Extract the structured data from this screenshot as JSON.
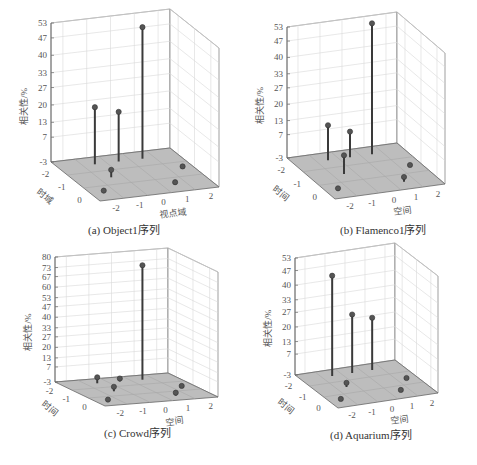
{
  "figure": {
    "panels": [
      {
        "id": "a",
        "caption": "(a) Object1序列",
        "zlabel": "相关性/%",
        "xlabel": "视点域",
        "ylabel": "时域"
      },
      {
        "id": "b",
        "caption": "(b) Flamenco1序列",
        "zlabel": "相关性/%",
        "xlabel": "空间",
        "ylabel": "时间"
      },
      {
        "id": "c",
        "caption": "(c) Crowd序列",
        "zlabel": "相关性/%",
        "xlabel": "空间",
        "ylabel": "时间"
      },
      {
        "id": "d",
        "caption": "(d) Aquarium序列",
        "zlabel": "相关性/%",
        "xlabel": "空间",
        "ylabel": "时间"
      }
    ]
  },
  "chart_data": [
    {
      "type": "scatter",
      "subtype": "3d-stem",
      "title": "(a) Object1序列",
      "xlabel": "视点域",
      "ylabel": "时域",
      "zlabel": "相关性/%",
      "xticks": [
        -2,
        -1,
        0,
        1,
        2
      ],
      "yticks": [
        -2,
        -1,
        0
      ],
      "zticks": [
        -3,
        7,
        13,
        20,
        27,
        33,
        40,
        47,
        53
      ],
      "zlim": [
        -3,
        53
      ],
      "points": [
        {
          "x": -1,
          "y": -2,
          "z": 20
        },
        {
          "x": 0,
          "y": -2,
          "z": 17
        },
        {
          "x": 1,
          "y": -2,
          "z": 50
        },
        {
          "x": -1,
          "y": -1,
          "z": 0
        },
        {
          "x": -2,
          "y": 0,
          "z": -2
        },
        {
          "x": 1,
          "y": 0,
          "z": -2
        },
        {
          "x": 2,
          "y": -1,
          "z": -2
        }
      ],
      "grid": true
    },
    {
      "type": "scatter",
      "subtype": "3d-stem",
      "title": "(b) Flamenco1序列",
      "xlabel": "空间",
      "ylabel": "时间",
      "zlabel": "相关性/%",
      "xticks": [
        -2,
        -1,
        0,
        1,
        2
      ],
      "yticks": [
        -2,
        -1,
        0
      ],
      "zticks": [
        -3,
        7,
        13,
        20,
        27,
        33,
        40,
        47,
        53
      ],
      "zlim": [
        -3,
        53
      ],
      "points": [
        {
          "x": -1,
          "y": -2,
          "z": 12
        },
        {
          "x": 0,
          "y": -2,
          "z": 8
        },
        {
          "x": 1,
          "y": -2,
          "z": 53
        },
        {
          "x": -1,
          "y": -1,
          "z": 5
        },
        {
          "x": -2,
          "y": 0,
          "z": -2
        },
        {
          "x": 1,
          "y": 0,
          "z": -1
        },
        {
          "x": 2,
          "y": -1,
          "z": -3
        }
      ],
      "grid": true
    },
    {
      "type": "scatter",
      "subtype": "3d-stem",
      "title": "(c) Crowd序列",
      "xlabel": "空间",
      "ylabel": "时间",
      "zlabel": "相关性/%",
      "xticks": [
        -2,
        -1,
        0,
        1,
        2
      ],
      "yticks": [
        -2,
        -1,
        0
      ],
      "zticks": [
        -3,
        7,
        13,
        20,
        27,
        33,
        40,
        47,
        53,
        60,
        67,
        73,
        80
      ],
      "zlim": [
        -3,
        80
      ],
      "points": [
        {
          "x": -1,
          "y": -2,
          "z": 1
        },
        {
          "x": 0,
          "y": -2,
          "z": -1
        },
        {
          "x": 1,
          "y": -2,
          "z": 73
        },
        {
          "x": -1,
          "y": -1,
          "z": 0
        },
        {
          "x": -2,
          "y": 0,
          "z": -2
        },
        {
          "x": 1,
          "y": 0,
          "z": -1
        },
        {
          "x": 2,
          "y": -1,
          "z": -3
        }
      ],
      "grid": true
    },
    {
      "type": "scatter",
      "subtype": "3d-stem",
      "title": "(d) Aquarium序列",
      "xlabel": "空间",
      "ylabel": "时间",
      "zlabel": "相关性/%",
      "xticks": [
        -2,
        -1,
        0,
        1,
        2
      ],
      "yticks": [
        -2,
        -1,
        0
      ],
      "zticks": [
        -3,
        7,
        13,
        20,
        27,
        33,
        40,
        47,
        53
      ],
      "zlim": [
        -3,
        53
      ],
      "points": [
        {
          "x": -1,
          "y": -2,
          "z": 45
        },
        {
          "x": 0,
          "y": -2,
          "z": 25
        },
        {
          "x": 1,
          "y": -2,
          "z": 22
        },
        {
          "x": -1,
          "y": -1,
          "z": -1
        },
        {
          "x": -2,
          "y": 0,
          "z": -2
        },
        {
          "x": 1,
          "y": 0,
          "z": -2
        },
        {
          "x": 2,
          "y": -1,
          "z": -3
        }
      ],
      "grid": true
    }
  ]
}
